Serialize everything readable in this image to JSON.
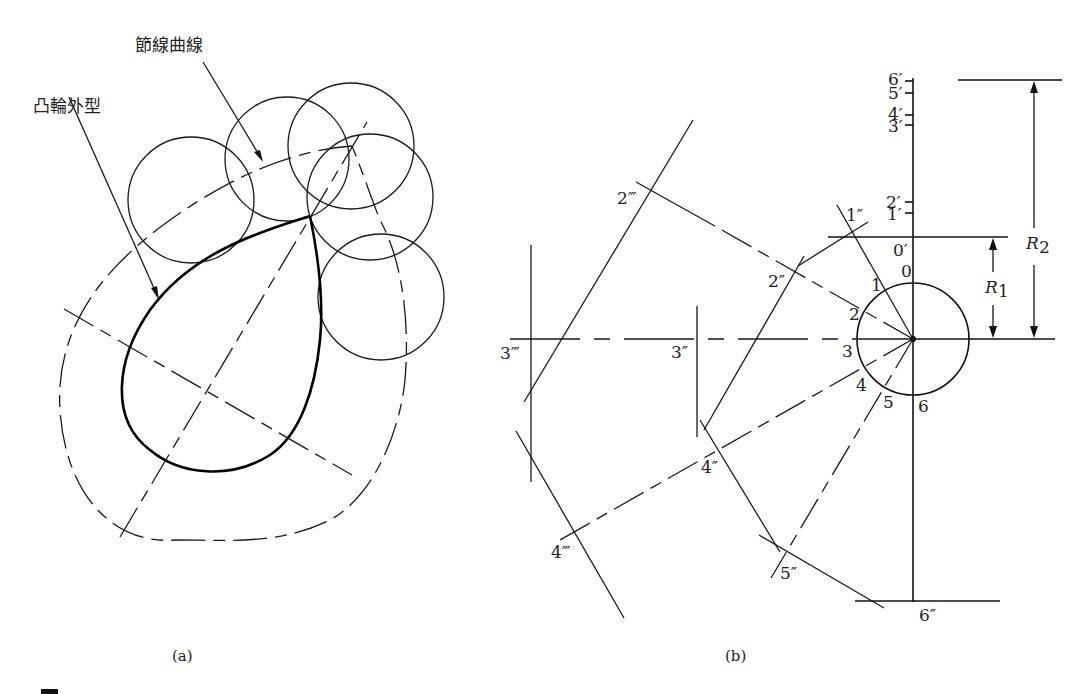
{
  "figure_a": {
    "caption": "(a)",
    "labels": {
      "pitch_curve": "節線曲線",
      "cam_profile": "凸輪外型"
    }
  },
  "figure_b": {
    "caption": "(b)",
    "dimensions": {
      "r1": "R",
      "r1_sub": "1",
      "r2": "R",
      "r2_sub": "2"
    },
    "circle_points": [
      "0",
      "1",
      "2",
      "3",
      "4",
      "5",
      "6"
    ],
    "axis_points_prime": [
      "0′",
      "1′",
      "2′",
      "3′",
      "4′",
      "5′",
      "6′"
    ],
    "double_prime_points": [
      "1″",
      "2″",
      "3″",
      "4″",
      "5″",
      "6″"
    ],
    "triple_prime_points": [
      "2‴",
      "3‴",
      "4‴"
    ]
  },
  "footer": {
    "figure_number_marker": "■"
  }
}
